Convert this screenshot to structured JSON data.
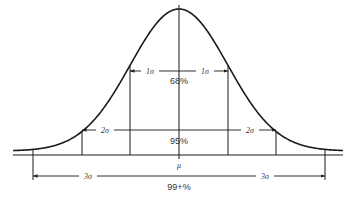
{
  "diagram": {
    "type": "normal-distribution",
    "center_label": "μ",
    "line_color": "#1a1a1a",
    "sigma_intervals": [
      {
        "k": 1,
        "left_label": "1σ",
        "right_label": "1σ",
        "coverage": "68%"
      },
      {
        "k": 2,
        "left_label": "2σ",
        "right_label": "2σ",
        "coverage": "95%"
      },
      {
        "k": 3,
        "left_label": "3σ",
        "right_label": "3σ",
        "coverage": "99+%"
      }
    ]
  }
}
